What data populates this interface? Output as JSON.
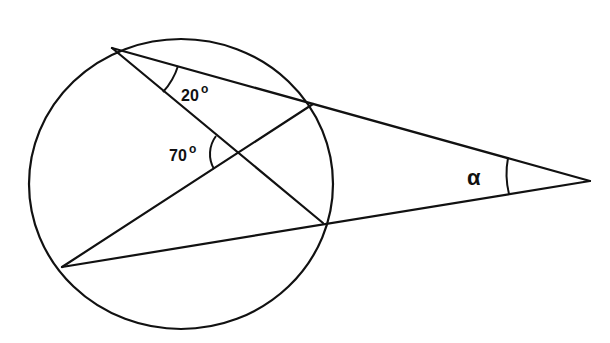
{
  "diagram": {
    "type": "circle-geometry",
    "angles": [
      {
        "id": "angle-20",
        "value": "20",
        "unit": "°",
        "location": "inscribed angle at top-left point of circle between chord and secant"
      },
      {
        "id": "angle-70",
        "value": "70",
        "unit": "°",
        "location": "angle at intersection of chords inside circle"
      },
      {
        "id": "angle-alpha",
        "value": "α",
        "unit": "",
        "location": "angle at external point between two secants"
      }
    ],
    "labels": {
      "angle_20": "20",
      "angle_70": "70",
      "alpha": "α",
      "degree_mark": "o"
    },
    "colors": {
      "stroke": "#111111",
      "background": "#ffffff"
    }
  }
}
